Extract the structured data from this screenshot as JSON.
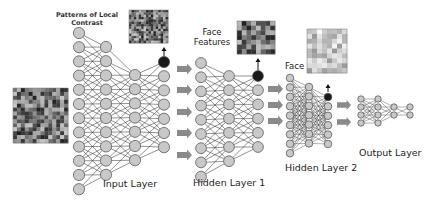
{
  "diagram": {
    "colors": {
      "node_fill": "#c8c8c8",
      "node_stroke": "#4a4a4a",
      "active_node": "#1a1a1a",
      "edge": "#2a2a2a",
      "arrow": "#8a8a8a",
      "text": "#222222"
    },
    "labels": {
      "local_contrast": "Patterns of Local Contrast",
      "local_contrast_line1": "Patterns of Local",
      "local_contrast_line2": "Contrast",
      "face_features_line1": "Face",
      "face_features_line2": "Features",
      "face": "Face",
      "input_layer": "Input Layer",
      "hidden_layer_1": "Hidden Layer 1",
      "hidden_layer_2": "Hidden Layer 2",
      "output_layer": "Output Layer"
    },
    "images": [
      {
        "name": "input-face-collage",
        "description": "grid of face photos (input)"
      },
      {
        "name": "local-contrast-patterns",
        "description": "edge/contrast filter grid"
      },
      {
        "name": "face-features-patterns",
        "description": "facial feature filter grid"
      },
      {
        "name": "face-patterns",
        "description": "whole-face filter grid"
      }
    ],
    "stages": [
      {
        "name": "Input Layer",
        "columns": [
          12,
          10,
          8,
          7
        ],
        "active_node_top": true
      },
      {
        "name": "Hidden Layer 1",
        "columns": [
          9,
          7,
          6
        ],
        "active_node_top": true
      },
      {
        "name": "Hidden Layer 2",
        "columns": [
          9,
          7,
          6
        ],
        "active_node_top": true
      },
      {
        "name": "Output Layer",
        "columns": [
          4,
          4,
          2,
          2
        ],
        "active_node_top": false
      }
    ],
    "connector_arrows": {
      "input_to_h1": 5,
      "h1_to_h2": 3,
      "h2_to_output": 2
    }
  }
}
